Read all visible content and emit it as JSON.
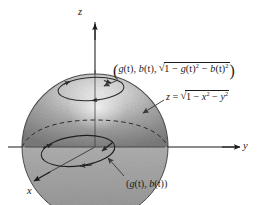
{
  "figure": {
    "background_color": "#ffffff",
    "ink_color": "#1a1a1a",
    "surface_fill_light": "#e8e8e8",
    "surface_fill_mid": "#9d9d9d",
    "surface_fill_dark": "#7b7b7b"
  },
  "axes": {
    "z": {
      "label": "z",
      "direction": "up"
    },
    "y": {
      "label": "y",
      "direction": "right"
    },
    "x": {
      "label": "x",
      "direction": "down-left"
    }
  },
  "labels": {
    "point_on_surface": {
      "open_paren": "(",
      "g": "g",
      "t1": "(t)",
      "comma1": ", ",
      "b": "b",
      "t2": "(t)",
      "comma2": ", ",
      "radicand_one": "1 − ",
      "g2": "g",
      "t3": "(t)",
      "exp2a": "2",
      "minus": " − ",
      "b2": "b",
      "t4": "(t)",
      "exp2b": "2",
      "close_paren": ")",
      "plain_text": "(g(t), b(t), √(1 − g(t)² − b(t)²))"
    },
    "surface_equation": {
      "z": "z",
      "equals": " = ",
      "radicand_one": "1 − ",
      "x": "x",
      "exp2a": "2",
      "minus": " − ",
      "y": "y",
      "exp2b": "2",
      "plain_text": "z = √(1 − x² − y²)"
    },
    "point_in_plane": {
      "open_paren": "(",
      "g": "g",
      "t1": "(t)",
      "comma": ", ",
      "b": "b",
      "t2": "(t)",
      "close_paren": ")",
      "plain_text": "(g(t), b(t))"
    }
  },
  "curves": {
    "surface_curve": {
      "name": "curve-on-hemisphere",
      "style": "solid",
      "has_direction_arrows": true,
      "arrow_count": 3
    },
    "plane_curve": {
      "name": "curve-in-xy-plane",
      "style": "solid",
      "has_direction_arrows": true,
      "arrow_count": 3
    },
    "hidden_rim": {
      "name": "hemisphere-back-rim",
      "style": "dashed"
    }
  },
  "leader_lines": {
    "to_surface_point": {
      "from": "point-on-surface-label",
      "to": "surface-curve"
    },
    "to_surface": {
      "from": "surface-equation-label",
      "to": "hemisphere-surface"
    },
    "to_plane_point": {
      "from": "point-in-plane-label",
      "to": "plane-curve"
    }
  }
}
